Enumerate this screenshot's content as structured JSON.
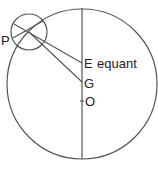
{
  "diagram": {
    "labels": {
      "p": "P",
      "e": "E",
      "equant": "equant",
      "g": "G",
      "o": "O"
    },
    "colors": {
      "stroke": "#555555",
      "text": "#222222"
    }
  }
}
